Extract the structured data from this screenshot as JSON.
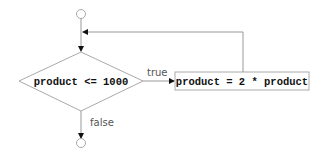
{
  "diagram": {
    "type": "flowchart",
    "title": "",
    "decision": {
      "label": "product <= 1000"
    },
    "action": {
      "label": "product = 2 * product"
    },
    "edges": {
      "true_label": "true",
      "false_label": "false"
    },
    "nodes": [
      {
        "id": "start",
        "shape": "circle"
      },
      {
        "id": "decision",
        "shape": "diamond",
        "text": "product <= 1000"
      },
      {
        "id": "action",
        "shape": "rectangle",
        "text": "product = 2 * product"
      },
      {
        "id": "end",
        "shape": "circle"
      }
    ],
    "connections": [
      {
        "from": "start",
        "to": "decision"
      },
      {
        "from": "decision",
        "to": "action",
        "label": "true"
      },
      {
        "from": "action",
        "to": "decision",
        "label": ""
      },
      {
        "from": "decision",
        "to": "end",
        "label": "false"
      }
    ],
    "colors": {
      "line": "#999999",
      "text": "#111111",
      "label": "#555555"
    }
  }
}
